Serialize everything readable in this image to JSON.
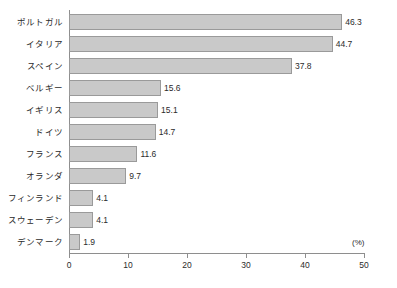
{
  "chart_data": {
    "type": "bar",
    "orientation": "horizontal",
    "title": "",
    "subtitle": "",
    "xlabel": "",
    "ylabel": "",
    "unit_label": "(%)",
    "categories": [
      "ポルトガル",
      "イタリア",
      "スペイン",
      "ベルギー",
      "イギリス",
      "ドイツ",
      "フランス",
      "オランダ",
      "フィンランド",
      "スウェーデン",
      "デンマーク"
    ],
    "values": [
      46.3,
      44.7,
      37.8,
      15.6,
      15.1,
      14.7,
      11.6,
      9.7,
      4.1,
      4.1,
      1.9
    ],
    "value_labels": [
      "46.3",
      "44.7",
      "37.8",
      "15.6",
      "15.1",
      "14.7",
      "11.6",
      "9.7",
      "4.1",
      "4.1",
      "1.9"
    ],
    "xlim": [
      0,
      50
    ],
    "xticks": [
      0,
      10,
      20,
      30,
      40,
      50
    ],
    "xtick_labels": [
      "0",
      "10",
      "20",
      "30",
      "40",
      "50"
    ],
    "grid": false,
    "legend": null,
    "colors": {
      "bar_fill": "#c9c9c9",
      "bar_stroke": "#9a9a9a",
      "axis": "#8e8e8e",
      "text": "#2b2b2b",
      "background": "#ffffff"
    }
  }
}
